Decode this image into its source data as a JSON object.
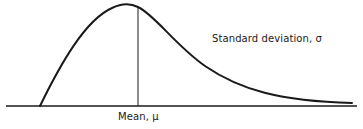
{
  "diagram": {
    "type": "skewed-distribution-curve",
    "colors": {
      "background": "#ffffff",
      "stroke": "#1a1a1a"
    },
    "labels": {
      "mean": "Mean, μ",
      "standard_deviation": "Standard deviation, σ"
    },
    "geometry": {
      "baseline": {
        "x1": 6,
        "y1": 106,
        "x2": 357,
        "y2": 106
      },
      "mean_line": {
        "x1": 138,
        "y1": 7,
        "x2": 138,
        "y2": 106
      },
      "curve_path": "M 40 106 C 60 65, 85 20, 112 8 C 122 3, 130 3, 138 7 C 155 15, 175 45, 205 66 C 240 90, 280 101, 352 103"
    }
  }
}
